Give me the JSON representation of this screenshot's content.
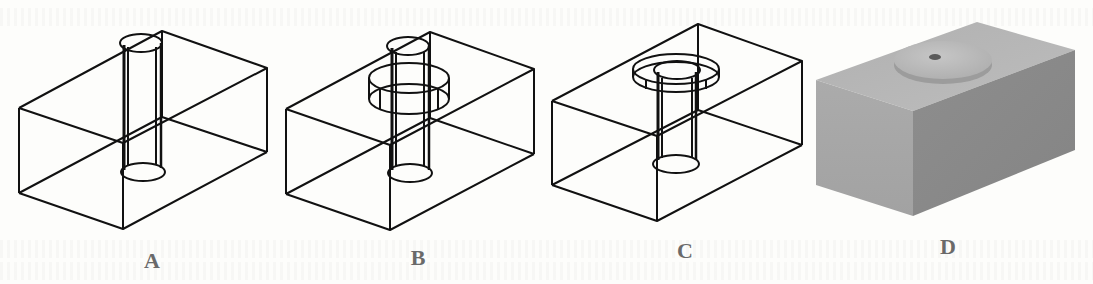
{
  "figure": {
    "panels": [
      {
        "id": "A",
        "label": "A",
        "style": "wireframe",
        "description": "Block with a single through-hole (cylinder)"
      },
      {
        "id": "B",
        "label": "B",
        "style": "wireframe",
        "description": "Block with through-hole and an intermediate wider cylindrical ring"
      },
      {
        "id": "C",
        "label": "C",
        "style": "wireframe",
        "description": "Block with through-hole and a counterbore ring at the top face"
      },
      {
        "id": "D",
        "label": "D",
        "style": "shaded",
        "description": "Shaded solid block with raised disc and hole on top"
      }
    ],
    "colors": {
      "line": "#111111",
      "label": "#6a6a6a",
      "shade_top": "#b8b8b8",
      "shade_left": "#a6a6a6",
      "shade_right": "#8c8c8c",
      "background": "#fdfdfb"
    }
  }
}
